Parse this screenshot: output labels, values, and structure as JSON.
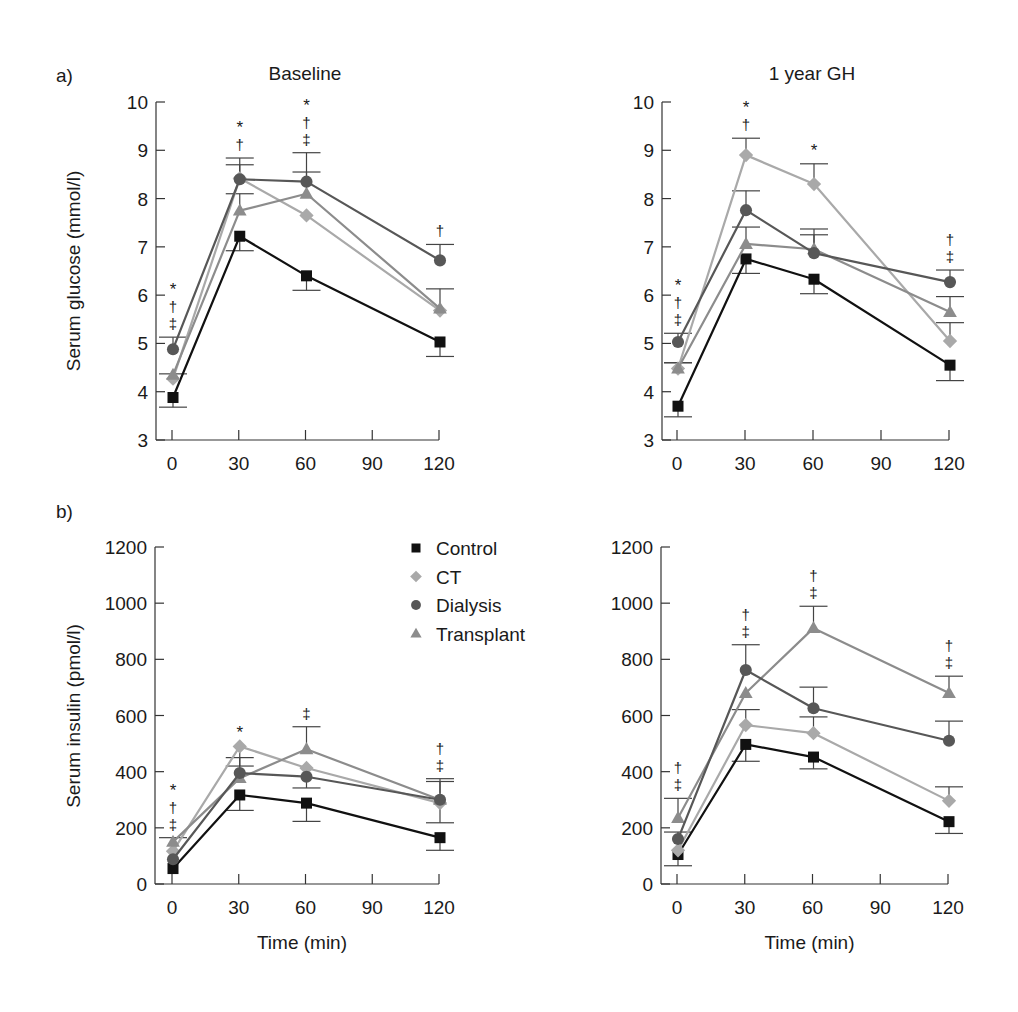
{
  "figure": {
    "panel_labels": [
      "a)",
      "b)"
    ],
    "legend": {
      "entries": [
        {
          "name": "Control",
          "marker": "square",
          "color": "#111111"
        },
        {
          "name": "CT",
          "marker": "diamond",
          "color": "#a9a9a9"
        },
        {
          "name": "Dialysis",
          "marker": "circle",
          "color": "#575757"
        },
        {
          "name": "Transplant",
          "marker": "triangle",
          "color": "#8c8c8c"
        }
      ]
    }
  },
  "chart_data": [
    {
      "id": "glucose-baseline",
      "type": "line",
      "title": "Baseline",
      "panel_label": "a)",
      "xlabel": "",
      "ylabel": "Serum glucose (mmol/l)",
      "x": [
        0,
        30,
        60,
        120
      ],
      "xticks": [
        0,
        30,
        60,
        90,
        120
      ],
      "yticks": [
        3,
        4,
        5,
        6,
        7,
        8,
        9,
        10
      ],
      "ylim": [
        3,
        10
      ],
      "series": [
        {
          "name": "Control",
          "values": [
            3.88,
            7.22,
            6.4,
            5.03
          ],
          "err": [
            -0.2,
            -0.3,
            -0.3,
            -0.3
          ]
        },
        {
          "name": "CT",
          "values": [
            4.27,
            8.42,
            7.65,
            5.68
          ],
          "err": [
            0.1,
            0.42,
            0,
            0.45
          ]
        },
        {
          "name": "Dialysis",
          "values": [
            4.88,
            8.4,
            8.35,
            6.72
          ],
          "err": [
            0.25,
            0.3,
            0.6,
            0.33
          ]
        },
        {
          "name": "Transplant",
          "values": [
            4.35,
            7.75,
            8.1,
            5.72
          ],
          "err": [
            0,
            0.35,
            0.45,
            0
          ]
        }
      ],
      "annotations": [
        {
          "x": 0,
          "marks": [
            "*",
            "†",
            "‡"
          ]
        },
        {
          "x": 30,
          "marks": [
            "*",
            "†"
          ]
        },
        {
          "x": 60,
          "marks": [
            "*",
            "†",
            "‡"
          ]
        },
        {
          "x": 120,
          "marks": [
            "†"
          ]
        }
      ]
    },
    {
      "id": "glucose-1year",
      "type": "line",
      "title": "1 year GH",
      "xlabel": "",
      "ylabel": "",
      "x": [
        0,
        30,
        60,
        120
      ],
      "xticks": [
        0,
        30,
        60,
        90,
        120
      ],
      "yticks": [
        3,
        4,
        5,
        6,
        7,
        8,
        9,
        10
      ],
      "ylim": [
        3,
        10
      ],
      "series": [
        {
          "name": "Control",
          "values": [
            3.7,
            6.75,
            6.33,
            4.55
          ],
          "err": [
            -0.22,
            -0.3,
            -0.3,
            -0.32
          ]
        },
        {
          "name": "CT",
          "values": [
            4.48,
            8.9,
            8.3,
            5.05
          ],
          "err": [
            0.12,
            0.35,
            0.42,
            0.38
          ]
        },
        {
          "name": "Dialysis",
          "values": [
            5.03,
            7.76,
            6.87,
            6.27
          ],
          "err": [
            0.18,
            0.4,
            0.5,
            0.25
          ]
        },
        {
          "name": "Transplant",
          "values": [
            4.48,
            7.06,
            6.95,
            5.65
          ],
          "err": [
            0.12,
            0.35,
            0.3,
            0.32
          ]
        }
      ],
      "annotations": [
        {
          "x": 0,
          "marks": [
            "*",
            "†",
            "‡"
          ]
        },
        {
          "x": 30,
          "marks": [
            "*",
            "†"
          ]
        },
        {
          "x": 60,
          "marks": [
            "*"
          ]
        },
        {
          "x": 120,
          "marks": [
            "†",
            "‡"
          ]
        }
      ]
    },
    {
      "id": "insulin-baseline",
      "type": "line",
      "title": "",
      "panel_label": "b)",
      "xlabel": "Time (min)",
      "ylabel": "Serum insulin (pmol/l)",
      "x": [
        0,
        30,
        60,
        120
      ],
      "xticks": [
        0,
        30,
        60,
        90,
        120
      ],
      "yticks": [
        0,
        200,
        400,
        600,
        800,
        1000,
        1200
      ],
      "ylim": [
        0,
        1200
      ],
      "series": [
        {
          "name": "Control",
          "values": [
            55,
            317,
            288,
            165
          ],
          "err": [
            0,
            -55,
            -65,
            -45
          ]
        },
        {
          "name": "CT",
          "values": [
            117,
            490,
            413,
            288
          ],
          "err": [
            0,
            -70,
            0,
            -70
          ]
        },
        {
          "name": "Dialysis",
          "values": [
            88,
            395,
            382,
            300
          ],
          "err": [
            0,
            55,
            -40,
            75
          ]
        },
        {
          "name": "Transplant",
          "values": [
            150,
            377,
            480,
            300
          ],
          "err": [
            15,
            0,
            80,
            65
          ]
        }
      ],
      "annotations": [
        {
          "x": 0,
          "marks": [
            "*",
            "†",
            "‡"
          ]
        },
        {
          "x": 30,
          "marks": [
            "*"
          ]
        },
        {
          "x": 60,
          "marks": [
            "‡"
          ]
        },
        {
          "x": 120,
          "marks": [
            "†",
            "‡"
          ]
        }
      ]
    },
    {
      "id": "insulin-1year",
      "type": "line",
      "title": "",
      "xlabel": "Time (min)",
      "ylabel": "",
      "x": [
        0,
        30,
        60,
        120
      ],
      "xticks": [
        0,
        30,
        60,
        90,
        120
      ],
      "yticks": [
        0,
        200,
        400,
        600,
        800,
        1000,
        1200
      ],
      "ylim": [
        0,
        1200
      ],
      "series": [
        {
          "name": "Control",
          "values": [
            105,
            497,
            452,
            222
          ],
          "err": [
            -40,
            -60,
            -42,
            -42
          ]
        },
        {
          "name": "CT",
          "values": [
            120,
            566,
            537,
            296
          ],
          "err": [
            0,
            55,
            58,
            50
          ]
        },
        {
          "name": "Dialysis",
          "values": [
            160,
            762,
            626,
            510
          ],
          "err": [
            25,
            90,
            75,
            70
          ]
        },
        {
          "name": "Transplant",
          "values": [
            235,
            680,
            911,
            680
          ],
          "err": [
            70,
            0,
            78,
            60
          ]
        }
      ],
      "annotations": [
        {
          "x": 0,
          "marks": [
            "†",
            "‡"
          ]
        },
        {
          "x": 30,
          "marks": [
            "†",
            "‡"
          ]
        },
        {
          "x": 60,
          "marks": [
            "†",
            "‡"
          ]
        },
        {
          "x": 120,
          "marks": [
            "†",
            "‡"
          ]
        }
      ]
    }
  ]
}
